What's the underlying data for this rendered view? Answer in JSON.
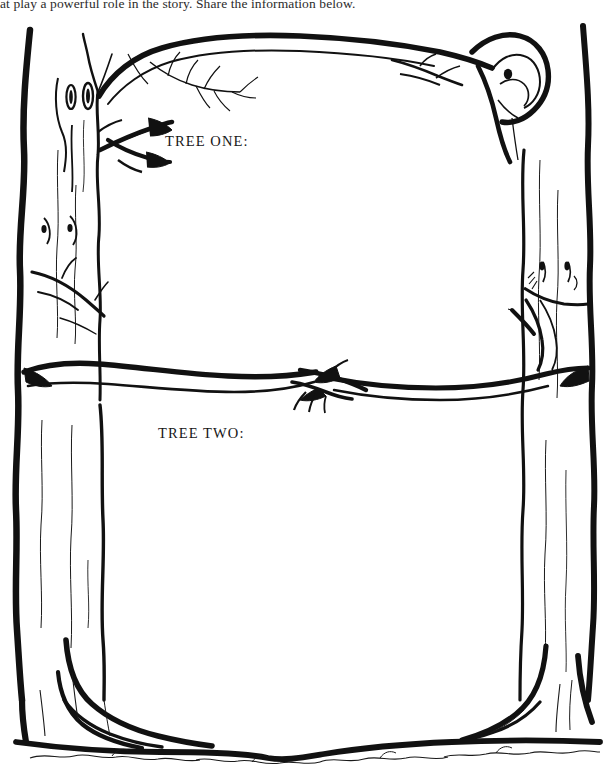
{
  "page": {
    "background_color": "#ffffff",
    "ink_color": "#101010",
    "width": 615,
    "height": 773
  },
  "instructions": {
    "text": "at play a powerful role in the story. Share the information below.",
    "note": "top line is clipped by the top edge of the page"
  },
  "fields": [
    {
      "id": "tree-one",
      "label": "TREE ONE:",
      "answer": ""
    },
    {
      "id": "tree-two",
      "label": "TREE TWO:",
      "answer": ""
    }
  ],
  "illustration": {
    "name": "two-bare-trees-frame",
    "description": "Two bare tree trunks drawn in black line art form the left and right sides of a frame. An upper branch arcs across the top and a horizontal branch crosses the middle, dividing the page into two blank writing panels. Roots flare at the bottom into a ground line with grass squiggles.",
    "elements": [
      "left-tree-trunk",
      "right-tree-trunk",
      "top-arching-branch",
      "middle-horizontal-branch",
      "bark-texture-lines",
      "knot-holes",
      "twig-clusters",
      "root-flares",
      "ground-line",
      "grass-squiggles"
    ]
  }
}
